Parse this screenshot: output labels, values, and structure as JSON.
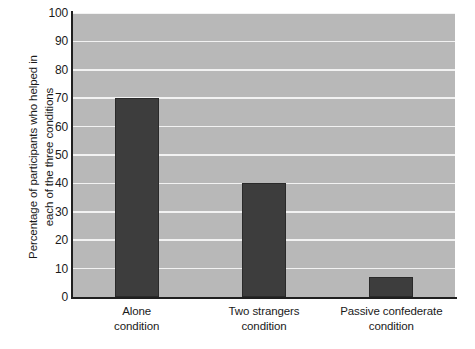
{
  "chart_data": {
    "type": "bar",
    "title": "",
    "xlabel": "",
    "ylabel": "Percentage of participants who helped in each of the three conditions",
    "ylabel_lines": [
      "Percentage of participants who helped in",
      "each of the three conditions"
    ],
    "categories": [
      "Alone condition",
      "Two strangers condition",
      "Passive confederate condition"
    ],
    "category_lines": [
      [
        "Alone",
        "condition"
      ],
      [
        "Two strangers",
        "condition"
      ],
      [
        "Passive confederate",
        "condition"
      ]
    ],
    "values": [
      70,
      40,
      7
    ],
    "ylim": [
      0,
      100
    ],
    "yticks": [
      100,
      90,
      80,
      70,
      60,
      50,
      40,
      30,
      20,
      10,
      0
    ],
    "ytick_labels": [
      "100",
      "90",
      "80",
      "70",
      "60",
      "50",
      "40",
      "30",
      "20",
      "10",
      "0"
    ],
    "grid": true,
    "legend": false,
    "colors": {
      "bar_fill": "#3d3d3d",
      "bar_edge": "#2a2a2a",
      "plot_background": "#b8b8b8",
      "gridline": "#f2f2f2",
      "axis": "#1f1f1f",
      "text": "#1a1a1a",
      "figure_background": "#ffffff"
    }
  }
}
